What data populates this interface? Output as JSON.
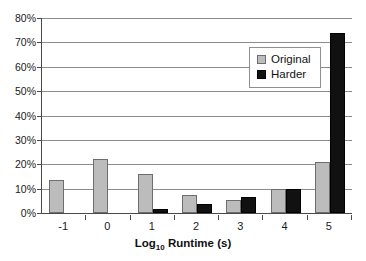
{
  "chart_data": {
    "type": "bar",
    "title": "",
    "xlabel": "Log10 Runtime (s)",
    "xlabel_base": "Log",
    "xlabel_sub": "10",
    "xlabel_rest": "Runtime (s)",
    "ylabel": "",
    "categories": [
      "-1",
      "0",
      "1",
      "2",
      "3",
      "4",
      "5"
    ],
    "ylim": [
      0,
      80
    ],
    "yticks": [
      0,
      10,
      20,
      30,
      40,
      50,
      60,
      70,
      80
    ],
    "ytick_labels": [
      "0%",
      "10%",
      "20%",
      "30%",
      "40%",
      "50%",
      "60%",
      "70%",
      "80%"
    ],
    "grid": true,
    "grid_axis": "y",
    "legend_position": "upper-right-inside",
    "series": [
      {
        "name": "Original",
        "color": "#bcbcbc",
        "edge_color": "#6d6d6d",
        "values": [
          13.5,
          22.0,
          16.0,
          7.5,
          5.5,
          10.0,
          21.0
        ]
      },
      {
        "name": "Harder",
        "color": "#111111",
        "edge_color": "#000000",
        "values": [
          0,
          0,
          1.5,
          3.5,
          6.5,
          10.0,
          74.0
        ]
      }
    ]
  },
  "legend": {
    "items": [
      {
        "label": "Original"
      },
      {
        "label": "Harder"
      }
    ]
  }
}
